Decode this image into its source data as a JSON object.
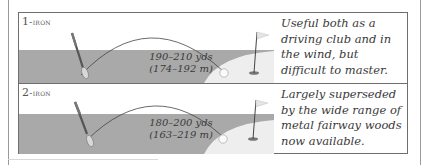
{
  "clubs": [
    {
      "number": "1",
      "name": "-iron",
      "distance_yds": "190–210 yds",
      "distance_m": "(174–192 m)",
      "description": "Useful both as a driving club and in the wind, but difficult to master."
    },
    {
      "number": "2",
      "name": "-iron",
      "distance_yds": "180–200 yds",
      "distance_m": "(163–219 m)",
      "description": "Largely superseded by the wide range of metal fairway woods now available."
    }
  ],
  "colors": {
    "fairway": "#a9a9a9",
    "green": "#eeeeee",
    "border": "#6e6e6e",
    "text": "#3a3a3a"
  }
}
